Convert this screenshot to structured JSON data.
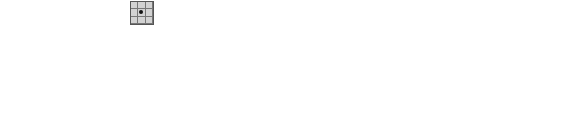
{
  "kernel": {
    "label": "B",
    "size": 3,
    "origin_marker": "center-dot"
  },
  "grid_size": 10,
  "ellipsis": "…",
  "panels": [
    {
      "id": "A",
      "label": "A",
      "sub": "",
      "left": 10,
      "on": [
        [
          1,
          6
        ],
        [
          1,
          7
        ],
        [
          1,
          8
        ],
        [
          2,
          6
        ],
        [
          2,
          7
        ],
        [
          2,
          8
        ],
        [
          3,
          5
        ],
        [
          3,
          6
        ],
        [
          3,
          8
        ],
        [
          4,
          5
        ],
        [
          4,
          6
        ],
        [
          4,
          7
        ],
        [
          4,
          8
        ],
        [
          5,
          3
        ],
        [
          5,
          4
        ],
        [
          5,
          5
        ],
        [
          6,
          2
        ],
        [
          6,
          3
        ],
        [
          6,
          4
        ],
        [
          7,
          1
        ],
        [
          7,
          4
        ],
        [
          8,
          2
        ],
        [
          8,
          3
        ],
        [
          8,
          4
        ]
      ]
    },
    {
      "id": "X0",
      "label": "X",
      "sub": "0",
      "left": 100,
      "on": [
        [
          6,
          3
        ]
      ]
    },
    {
      "id": "X1",
      "label": "X",
      "sub": "1",
      "left": 190,
      "on": [
        [
          5,
          3
        ],
        [
          5,
          4
        ],
        [
          6,
          2
        ],
        [
          6,
          3
        ],
        [
          6,
          4
        ],
        [
          7,
          4
        ]
      ]
    },
    {
      "id": "X2",
      "label": "X",
      "sub": "2",
      "left": 282,
      "on": [
        [
          4,
          5
        ],
        [
          5,
          3
        ],
        [
          5,
          4
        ],
        [
          5,
          5
        ],
        [
          6,
          2
        ],
        [
          6,
          3
        ],
        [
          6,
          4
        ],
        [
          7,
          1
        ],
        [
          7,
          4
        ],
        [
          8,
          3
        ],
        [
          8,
          4
        ]
      ]
    },
    {
      "id": "X3",
      "label": "X",
      "sub": "3",
      "left": 372,
      "on": [
        [
          3,
          5
        ],
        [
          3,
          6
        ],
        [
          4,
          5
        ],
        [
          4,
          6
        ],
        [
          5,
          3
        ],
        [
          5,
          4
        ],
        [
          5,
          5
        ],
        [
          6,
          2
        ],
        [
          6,
          3
        ],
        [
          6,
          4
        ],
        [
          7,
          1
        ],
        [
          7,
          4
        ],
        [
          8,
          2
        ],
        [
          8,
          3
        ],
        [
          8,
          4
        ]
      ]
    },
    {
      "id": "X6",
      "label": "X",
      "sub": "6",
      "left": 470,
      "on": [
        [
          1,
          6
        ],
        [
          1,
          7
        ],
        [
          1,
          8
        ],
        [
          2,
          6
        ],
        [
          2,
          7
        ],
        [
          2,
          8
        ],
        [
          3,
          5
        ],
        [
          3,
          6
        ],
        [
          3,
          8
        ],
        [
          4,
          5
        ],
        [
          4,
          6
        ],
        [
          4,
          7
        ],
        [
          4,
          8
        ],
        [
          5,
          3
        ],
        [
          5,
          4
        ],
        [
          5,
          5
        ],
        [
          6,
          2
        ],
        [
          6,
          3
        ],
        [
          6,
          4
        ],
        [
          7,
          1
        ],
        [
          7,
          4
        ],
        [
          8,
          2
        ],
        [
          8,
          3
        ],
        [
          8,
          4
        ]
      ]
    }
  ],
  "colors": {
    "filled": "#cfcfcf",
    "grid_line": "#555555",
    "background": "#ffffff"
  }
}
